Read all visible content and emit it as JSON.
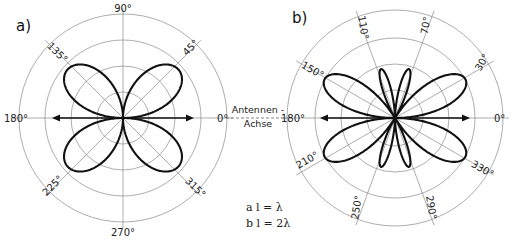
{
  "chart_data": [
    {
      "type": "polar",
      "panel_label": "a)",
      "title": "Richtdiagramm Antenne, l = λ",
      "angle_labels": [
        "0°",
        "45°",
        "90°",
        "135°",
        "180°",
        "225°",
        "270°",
        "315°"
      ],
      "angles_deg": [
        0,
        45,
        90,
        135,
        180,
        225,
        270,
        315
      ],
      "rings": 4,
      "lobes": 4,
      "lobe_directions_deg": [
        50,
        130,
        230,
        310
      ],
      "null_directions_deg": [
        0,
        90,
        180,
        270
      ]
    },
    {
      "type": "polar",
      "panel_label": "b)",
      "title": "Richtdiagramm Antenne, l = 2λ",
      "angle_labels": [
        "0°",
        "30°",
        "70°",
        "110°",
        "150°",
        "180°",
        "210°",
        "250°",
        "290°",
        "330°"
      ],
      "angles_deg": [
        0,
        30,
        70,
        110,
        150,
        180,
        210,
        250,
        290,
        330
      ],
      "rings": 4,
      "lobes": 8,
      "main_lobe_directions_deg": [
        30,
        150,
        210,
        330
      ],
      "minor_lobe_directions_deg": [
        70,
        110,
        250,
        290
      ]
    }
  ],
  "center_label": {
    "line1": "Antennen -",
    "line2": "Achse"
  },
  "legend": {
    "a": "a  l = λ",
    "b": "b  l = 2λ"
  },
  "colors": {
    "curve": "#111111",
    "grid": "#8a8a8a",
    "background": "#ffffff"
  }
}
